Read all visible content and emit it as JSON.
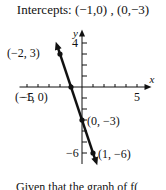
{
  "header": {
    "title": "Intercepts:  (−1,0) , (0,−3)"
  },
  "caption": "Given that the graph of  f(",
  "chart_data": {
    "type": "line",
    "xlabel": "x",
    "ylabel": "y",
    "xlim": [
      -5.5,
      5.5
    ],
    "ylim": [
      -7,
      4.5
    ],
    "x_tick_labels": [
      "−5",
      "5"
    ],
    "y_tick_labels": [
      "4",
      "−6"
    ],
    "grid": false,
    "series": [
      {
        "name": "y = −3x − 3",
        "x": [
          -2,
          -1,
          0,
          1
        ],
        "y": [
          3,
          0,
          -3,
          -6
        ]
      }
    ],
    "annotations": [
      {
        "label": "(−2, 3)",
        "x": -2,
        "y": 3
      },
      {
        "label": "(−1, 0)",
        "x": -1,
        "y": 0
      },
      {
        "label": "(0, −3)",
        "x": 0,
        "y": -3
      },
      {
        "label": "(1, −6)",
        "x": 1,
        "y": -6
      }
    ],
    "color": "#111111"
  }
}
